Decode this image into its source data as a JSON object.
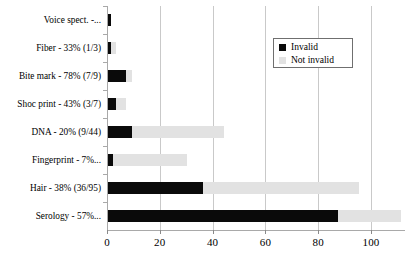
{
  "chart_data": {
    "type": "bar",
    "orientation": "horizontal",
    "stacked": true,
    "title": "",
    "xlabel": "",
    "ylabel": "",
    "xlim": [
      0,
      113
    ],
    "xticks": [
      0,
      20,
      40,
      60,
      80,
      100
    ],
    "xtick_labels": [
      "0",
      "20",
      "40",
      "60",
      "80",
      "100"
    ],
    "grid": "vertical",
    "legend": {
      "position": "top-right",
      "entries": [
        {
          "label": "Invalid",
          "color": "#0a0a0a"
        },
        {
          "label": "Not invalid",
          "color": "#e2e2e2"
        }
      ]
    },
    "categories": [
      "Voice spect. -...",
      "Fiber - 33% (1/3)",
      "Bite mark - 78% (7/9)",
      "Shoc print - 43% (3/7)",
      "DNA - 20% (9/44)",
      "Fingerprint - 7%...",
      "Hair - 38% (36/95)",
      "Serology - 57%..."
    ],
    "series": [
      {
        "name": "Invalid",
        "color": "#0a0a0a",
        "values": [
          1,
          1,
          7,
          3,
          9,
          2,
          36,
          87
        ]
      },
      {
        "name": "Not invalid",
        "color": "#e2e2e2",
        "values": [
          0,
          2,
          2,
          4,
          35,
          28,
          59,
          24
        ]
      }
    ],
    "totals": [
      1,
      3,
      9,
      7,
      44,
      30,
      95,
      111
    ]
  }
}
